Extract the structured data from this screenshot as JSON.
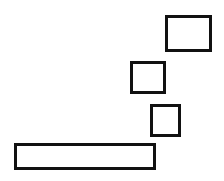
{
  "diagram": {
    "background": "#ffffff",
    "stroke_color": "#111111",
    "stroke_width": 3,
    "shapes": [
      {
        "id": "rect-1",
        "type": "rectangle",
        "x": 165,
        "y": 15,
        "width": 47,
        "height": 37
      },
      {
        "id": "rect-2",
        "type": "rectangle",
        "x": 130,
        "y": 61,
        "width": 36,
        "height": 33
      },
      {
        "id": "rect-3",
        "type": "rectangle",
        "x": 150,
        "y": 104,
        "width": 31,
        "height": 33
      },
      {
        "id": "rect-4",
        "type": "rectangle",
        "x": 14,
        "y": 143,
        "width": 142,
        "height": 27
      }
    ]
  }
}
